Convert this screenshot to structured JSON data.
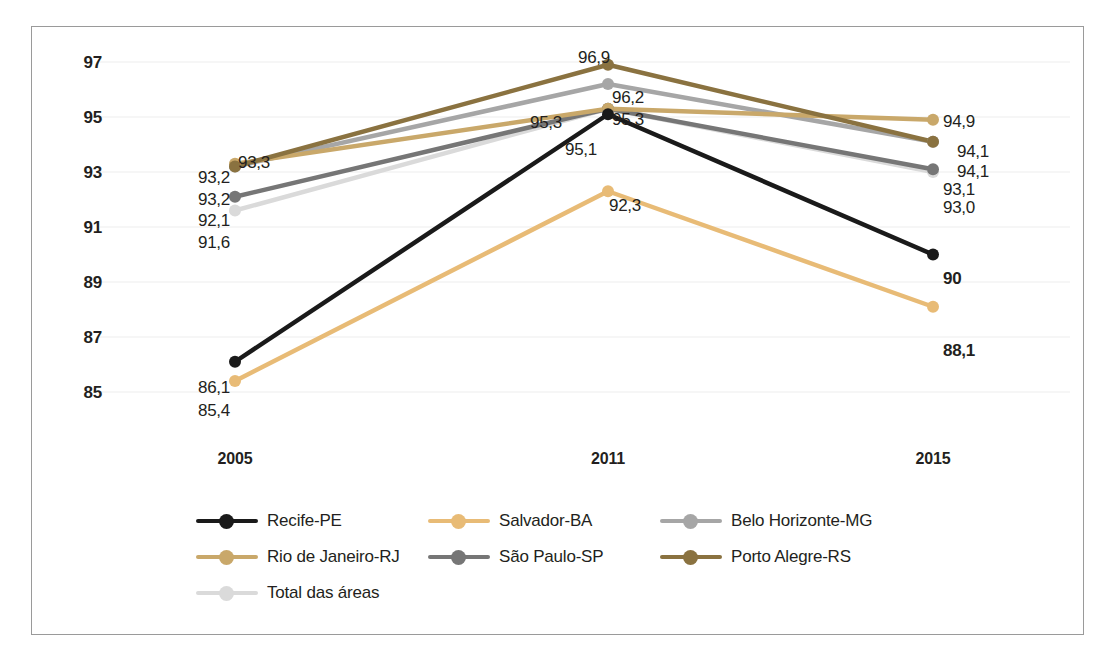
{
  "chart_data": {
    "type": "line",
    "title": "",
    "xlabel": "",
    "ylabel": "",
    "categories": [
      "2005",
      "2011",
      "2015"
    ],
    "ylim": [
      84,
      98
    ],
    "yticks": [
      "85",
      "87",
      "89",
      "91",
      "93",
      "95",
      "97"
    ],
    "grid": true,
    "legend_position": "bottom",
    "series": [
      {
        "name": "Recife-PE",
        "color": "#1a1a1a",
        "values": [
          86.1,
          95.1,
          90.0
        ],
        "labels": [
          "86,1",
          "95,1",
          "90"
        ]
      },
      {
        "name": "Salvador-BA",
        "color": "#e8bb76",
        "values": [
          85.4,
          92.3,
          88.1
        ],
        "labels": [
          "85,4",
          "92,3",
          "88,1"
        ]
      },
      {
        "name": "Belo Horizonte-MG",
        "color": "#a6a6a6",
        "values": [
          93.2,
          96.2,
          94.1
        ],
        "labels": [
          "93,2",
          "96,2",
          "94,1"
        ]
      },
      {
        "name": "Rio de Janeiro-RJ",
        "color": "#c9a86a",
        "values": [
          93.3,
          95.3,
          94.9
        ],
        "labels": [
          "93,3",
          "95,3",
          "94,9"
        ]
      },
      {
        "name": "São Paulo-SP",
        "color": "#767676",
        "values": [
          92.1,
          95.3,
          93.1
        ],
        "labels": [
          "92,1",
          "95,3",
          "93,1"
        ]
      },
      {
        "name": "Porto Alegre-RS",
        "color": "#8a7240",
        "values": [
          93.2,
          96.9,
          94.1
        ],
        "labels": [
          "93,2",
          "96,9",
          "94,1"
        ]
      },
      {
        "name": "Total das áreas",
        "color": "#dadada",
        "values": [
          91.6,
          95.3,
          93.0
        ],
        "labels": [
          "91,6",
          "95,3",
          "93,0"
        ]
      }
    ]
  },
  "axes": {
    "yticks": [
      "97",
      "95",
      "93",
      "91",
      "89",
      "87",
      "85"
    ],
    "xticks": [
      "2005",
      "2011",
      "2015"
    ]
  },
  "data_labels": {
    "y2005": [
      "93,3",
      "93,2",
      "93,2",
      "92,1",
      "91,6",
      "86,1",
      "85,4"
    ],
    "y2011": [
      "96,9",
      "96,2",
      "95,3",
      "95,3",
      "95,1",
      "92,3"
    ],
    "y2015": [
      "94,9",
      "94,1",
      "94,1",
      "93,1",
      "93,0",
      "90",
      "88,1"
    ]
  },
  "legend": {
    "items": [
      {
        "label": "Recife-PE",
        "color": "#1a1a1a"
      },
      {
        "label": "Salvador-BA",
        "color": "#e8bb76"
      },
      {
        "label": "Belo Horizonte-MG",
        "color": "#a6a6a6"
      },
      {
        "label": "Rio de Janeiro-RJ",
        "color": "#c9a86a"
      },
      {
        "label": "São Paulo-SP",
        "color": "#767676"
      },
      {
        "label": "Porto Alegre-RS",
        "color": "#8a7240",
        "label_alt": "Porto Alegre-RS"
      },
      {
        "label": "Total das áreas",
        "color": "#dadada"
      }
    ]
  },
  "colors": {
    "frame": "#9a9a9a",
    "grid": "#ededed",
    "text": "#231f20",
    "background": "#ffffff"
  }
}
